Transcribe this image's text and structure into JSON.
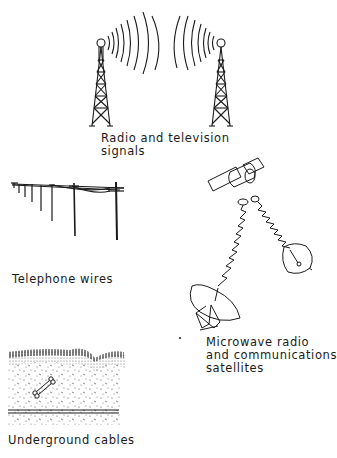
{
  "diagram": {
    "panels": [
      {
        "id": "radio-tv",
        "label_lines": [
          "Radio and television",
          "signals"
        ],
        "icon": "radio-tower-icon"
      },
      {
        "id": "telephone",
        "label_lines": [
          "Telephone wires"
        ],
        "icon": "telephone-pole-icon"
      },
      {
        "id": "microwave",
        "label_lines": [
          "Microwave radio",
          "and communications",
          "satellites"
        ],
        "icon": "satellite-dish-icon"
      },
      {
        "id": "underground",
        "label_lines": [
          "Underground cables"
        ],
        "icon": "underground-cable-icon"
      }
    ],
    "colors": {
      "ink": "#1a1a1a",
      "background": "#ffffff"
    }
  }
}
